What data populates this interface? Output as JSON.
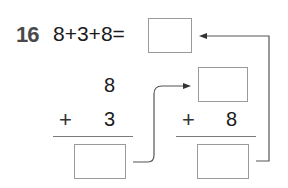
{
  "problem": {
    "number": "16",
    "expression": "8+3+8=",
    "answer_box": ""
  },
  "left_column": {
    "top_operand": "8",
    "operator": "+",
    "bottom_operand": "3",
    "answer_box": ""
  },
  "right_column": {
    "top_operand_box": "",
    "operator": "+",
    "bottom_operand": "8",
    "answer_box": ""
  },
  "colors": {
    "line": "#555555",
    "box_border": "#9a9a9a",
    "number": "#4a4a4a"
  }
}
